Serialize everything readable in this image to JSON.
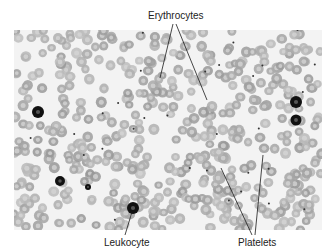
{
  "figure": {
    "labels": {
      "erythrocytes": "Erythrocytes",
      "leukocyte": "Leukocyte",
      "platelets": "Platelets"
    },
    "colors": {
      "background": "#ffffff",
      "smear": "#f3f3f3",
      "erythrocyte": "#a9a9a9",
      "erythrocyte_center": "#d4d4d4",
      "leukocyte_nucleus": "#111111",
      "platelet": "#333333",
      "leader_line": "#1a1a1a",
      "text": "#222222"
    }
  }
}
